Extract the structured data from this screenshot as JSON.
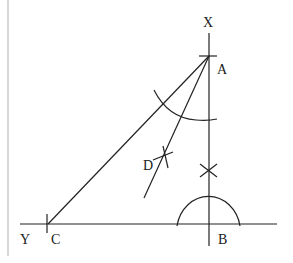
{
  "diagram": {
    "type": "geometric-construction",
    "labels": {
      "X": "X",
      "A": "A",
      "D": "D",
      "Y": "Y",
      "C": "C",
      "B": "B"
    },
    "points": {
      "X": [
        209,
        20
      ],
      "A": [
        209,
        55
      ],
      "B": [
        209,
        224
      ],
      "C": [
        47,
        224
      ],
      "D": [
        163,
        166
      ]
    },
    "lines": [
      {
        "name": "XB-perpendicular",
        "from": "X",
        "to": "B"
      },
      {
        "name": "YB-base",
        "from": "Y",
        "to": "B"
      },
      {
        "name": "AC",
        "from": "A",
        "to": "C"
      },
      {
        "name": "AD-bisector",
        "from": "A",
        "to": "D"
      }
    ],
    "colors": {
      "stroke": "#222222",
      "border": "#bdbdbd",
      "background": "#ffffff"
    }
  }
}
